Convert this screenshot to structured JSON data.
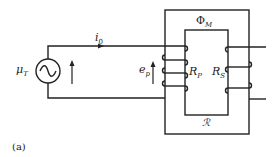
{
  "figure": {
    "panel_label": "(a)",
    "source": {
      "label": "μ",
      "sub": "T"
    },
    "current": {
      "label": "i",
      "sub": "0"
    },
    "emf": {
      "label": "e",
      "sub": "p"
    },
    "flux": {
      "label": "Φ",
      "sub": "M"
    },
    "primary_resistance": {
      "label": "R",
      "sub": "P"
    },
    "secondary_resistance": {
      "label": "R",
      "sub": "S"
    },
    "reluctance": {
      "label": "ℛ"
    }
  },
  "colors": {
    "stroke": "#222222",
    "background": "#ffffff"
  }
}
